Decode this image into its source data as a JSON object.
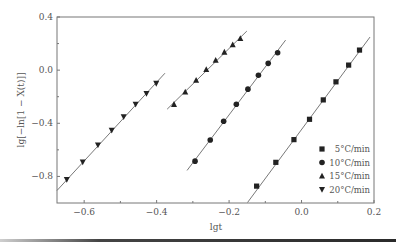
{
  "chart_data": {
    "type": "scatter",
    "title": "",
    "xlabel": "lgt",
    "ylabel": "lg[−ln[1 − X(t)]]",
    "xlim": [
      -0.675,
      0.2
    ],
    "ylim": [
      -1.0,
      0.4
    ],
    "xticks": [
      -0.6,
      -0.4,
      -0.2,
      0.0,
      0.2
    ],
    "xtick_labels": [
      "−0.6",
      "−0.4",
      "−0.2",
      "0.0",
      "0.2"
    ],
    "yticks": [
      0.4,
      0.0,
      -0.4,
      -0.8
    ],
    "ytick_labels": [
      "0.4",
      "0.0",
      "−0.4",
      "−0.8"
    ],
    "grid": false,
    "legend_position": "lower right",
    "series": [
      {
        "name": "5°C/min",
        "marker": "square",
        "x": [
          -0.124,
          -0.071,
          -0.021,
          0.022,
          0.06,
          0.095,
          0.13,
          0.16
        ],
        "y": [
          -0.873,
          -0.694,
          -0.523,
          -0.37,
          -0.224,
          -0.088,
          0.038,
          0.151
        ],
        "fit_line": {
          "x": [
            -0.149,
            0.189
          ],
          "y": [
            -0.996,
            0.249
          ]
        }
      },
      {
        "name": "10°C/min",
        "marker": "circle",
        "x": [
          -0.294,
          -0.252,
          -0.215,
          -0.18,
          -0.148,
          -0.119,
          -0.092,
          -0.066
        ],
        "y": [
          -0.685,
          -0.526,
          -0.385,
          -0.257,
          -0.143,
          -0.038,
          0.051,
          0.131
        ],
        "fit_line": {
          "x": [
            -0.316,
            -0.044
          ],
          "y": [
            -0.755,
            0.226
          ]
        }
      },
      {
        "name": "15°C/min",
        "marker": "triangle-up",
        "x": [
          -0.352,
          -0.321,
          -0.291,
          -0.263,
          -0.237,
          -0.213,
          -0.19,
          -0.169
        ],
        "y": [
          -0.257,
          -0.164,
          -0.075,
          0.005,
          0.075,
          0.136,
          0.191,
          0.239
        ],
        "fit_line": {
          "x": [
            -0.371,
            -0.151
          ],
          "y": [
            -0.294,
            0.294
          ]
        }
      },
      {
        "name": "20°C/min",
        "marker": "triangle-down",
        "x": [
          -0.648,
          -0.604,
          -0.562,
          -0.524,
          -0.491,
          -0.458,
          -0.428,
          -0.401
        ],
        "y": [
          -0.823,
          -0.692,
          -0.564,
          -0.453,
          -0.352,
          -0.257,
          -0.176,
          -0.1
        ],
        "fit_line": {
          "x": [
            -0.675,
            -0.377
          ],
          "y": [
            -0.906,
            -0.023
          ]
        }
      }
    ]
  },
  "legend": {
    "items": [
      {
        "label": "5°C/min",
        "marker": "square"
      },
      {
        "label": "10°C/min",
        "marker": "circle"
      },
      {
        "label": "15°C/min",
        "marker": "triangle-up"
      },
      {
        "label": "20°C/min",
        "marker": "triangle-down"
      }
    ]
  },
  "colors": {
    "axis": "#777777",
    "marker": "#222222",
    "fit_line": "#555555",
    "text": "#555555"
  }
}
